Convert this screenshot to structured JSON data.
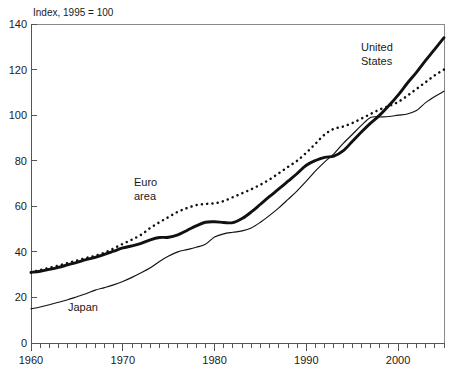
{
  "chart_data": {
    "type": "line",
    "title": "Index, 1995 = 100",
    "xlabel": "",
    "ylabel": "",
    "xlim": [
      1960,
      2005
    ],
    "ylim": [
      0,
      140
    ],
    "yticks": [
      0,
      20,
      40,
      60,
      80,
      100,
      120,
      140
    ],
    "xticks": [
      1960,
      1970,
      1980,
      1990,
      2000
    ],
    "grid": false,
    "legend": "inline-annotations",
    "annotations": [
      {
        "text": "United States",
        "x": 1996,
        "y": 127,
        "series": "United States"
      },
      {
        "text": "Euro area",
        "x": 1972,
        "y": 72,
        "series": "Euro area"
      },
      {
        "text": "Japan",
        "x": 1964,
        "y": 11,
        "series": "Japan"
      }
    ],
    "x": [
      1960,
      1961,
      1962,
      1963,
      1964,
      1965,
      1966,
      1967,
      1968,
      1969,
      1970,
      1971,
      1972,
      1973,
      1974,
      1975,
      1976,
      1977,
      1978,
      1979,
      1980,
      1981,
      1982,
      1983,
      1984,
      1985,
      1986,
      1987,
      1988,
      1989,
      1990,
      1991,
      1992,
      1993,
      1994,
      1995,
      1996,
      1997,
      1998,
      1999,
      2000,
      2001,
      2002,
      2003,
      2004,
      2005
    ],
    "series": [
      {
        "name": "United States",
        "style": "thick-solid",
        "values": [
          31.0,
          31.5,
          32.3,
          33.2,
          34.3,
          35.4,
          36.6,
          37.6,
          38.9,
          40.3,
          41.7,
          42.6,
          43.7,
          45.3,
          46.3,
          46.4,
          47.5,
          49.4,
          51.4,
          53.0,
          53.2,
          52.9,
          52.8,
          54.6,
          57.5,
          60.9,
          64.3,
          67.6,
          71.0,
          74.4,
          78.0,
          80.1,
          81.5,
          82.0,
          84.3,
          88.4,
          92.6,
          96.5,
          100.0,
          104.2,
          108.8,
          114.0,
          118.8,
          124.0,
          129.0,
          134.0
        ]
      },
      {
        "name": "Euro area",
        "style": "dotted",
        "values": [
          31.0,
          32.0,
          33.0,
          34.0,
          35.1,
          36.2,
          37.3,
          38.3,
          39.6,
          41.5,
          43.5,
          45.4,
          47.5,
          50.5,
          53.0,
          55.3,
          57.6,
          59.2,
          60.5,
          61.0,
          61.3,
          62.3,
          64.0,
          65.7,
          67.5,
          69.5,
          71.8,
          74.5,
          77.3,
          80.0,
          83.5,
          87.5,
          91.5,
          94.0,
          95.0,
          96.5,
          98.5,
          100.5,
          102.5,
          104.0,
          105.8,
          108.5,
          111.5,
          114.5,
          117.5,
          120.0
        ]
      },
      {
        "name": "Japan",
        "style": "thin-solid",
        "values": [
          15.0,
          15.8,
          16.8,
          17.9,
          19.0,
          20.3,
          21.6,
          23.2,
          24.3,
          25.5,
          27.0,
          28.8,
          30.8,
          33.0,
          35.8,
          38.2,
          40.0,
          41.0,
          42.0,
          43.3,
          46.5,
          47.9,
          48.6,
          49.2,
          50.5,
          53.0,
          56.0,
          59.3,
          63.0,
          66.8,
          71.0,
          75.5,
          79.5,
          83.0,
          87.5,
          91.5,
          95.5,
          99.0,
          99.2,
          99.4,
          100.0,
          100.5,
          102.0,
          105.5,
          108.2,
          110.5
        ]
      }
    ]
  },
  "axes": {
    "y_tick_labels": [
      "0",
      "20",
      "40",
      "60",
      "80",
      "100",
      "120",
      "140"
    ],
    "x_tick_labels": [
      "1960",
      "1970",
      "1980",
      "1990",
      "2000"
    ]
  },
  "labels": {
    "title": "Index, 1995 = 100",
    "united_states": "United",
    "united_states_2": "States",
    "euro": "Euro",
    "euro_2": "area",
    "japan": "Japan"
  }
}
